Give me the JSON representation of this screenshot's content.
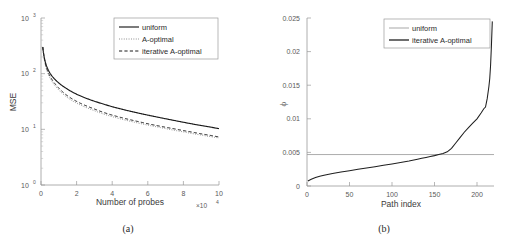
{
  "figure": {
    "background": "#ffffff",
    "panels": [
      "(a)",
      "(b)"
    ]
  },
  "panel_a": {
    "caption": "(a)",
    "xlabel": "Number of probes",
    "ylabel": "MSE",
    "x_multiplier": "×10",
    "x_multiplier_exp": "4",
    "xticks": [
      "0",
      "2",
      "4",
      "6",
      "8",
      "10"
    ],
    "yticks": [
      "10",
      "10",
      "10",
      "10"
    ],
    "ytick_exps": [
      "3",
      "2",
      "1",
      "0"
    ],
    "legend": [
      {
        "label": "uniform",
        "style": "solid",
        "color": "#1a1a1a"
      },
      {
        "label": "A-optimal",
        "style": "dotted",
        "color": "#7d7d7d"
      },
      {
        "label": "iterative A-optimal",
        "style": "dashed",
        "color": "#1a1a1a"
      }
    ]
  },
  "panel_b": {
    "caption": "(b)",
    "xlabel": "Path index",
    "ylabel": "ϕ",
    "xticks": [
      "0",
      "50",
      "100",
      "150",
      "200"
    ],
    "yticks": [
      "0",
      "0.005",
      "0.01",
      "0.015",
      "0.02",
      "0.025"
    ],
    "legend": [
      {
        "label": "uniform",
        "style": "solid",
        "color": "#9d9d9d"
      },
      {
        "label": "iterative A-optimal",
        "style": "solid",
        "color": "#1f1f1f"
      }
    ]
  },
  "chart_data": [
    {
      "type": "line",
      "panel": "(a)",
      "title": "",
      "xlabel": "Number of probes",
      "ylabel": "MSE",
      "xlim": [
        0,
        100000
      ],
      "ylim": [
        1,
        1000
      ],
      "yscale": "log",
      "xscale": "linear",
      "grid": false,
      "legend_position": "top-right",
      "x_tick_values": [
        0,
        20000,
        40000,
        60000,
        80000,
        100000
      ],
      "x_tick_multiplier": 10000,
      "y_tick_values": [
        1,
        10,
        100,
        1000
      ],
      "x": [
        1000,
        2000,
        3000,
        4000,
        6000,
        8000,
        10000,
        14000,
        18000,
        22000,
        26000,
        30000,
        35000,
        40000,
        45000,
        50000,
        55000,
        60000,
        65000,
        70000,
        75000,
        80000,
        85000,
        90000,
        95000,
        100000
      ],
      "series": [
        {
          "name": "uniform",
          "style": "solid",
          "color": "#1a1a1a",
          "values": [
            300,
            185,
            140,
            118,
            92,
            78,
            68,
            55,
            46,
            40,
            35.5,
            32,
            28.5,
            25.5,
            23.2,
            21.2,
            19.5,
            18.0,
            16.7,
            15.5,
            14.4,
            13.4,
            12.5,
            11.7,
            11.0,
            10.3
          ]
        },
        {
          "name": "A-optimal",
          "style": "dotted",
          "color": "#7d7d7d",
          "values": [
            300,
            170,
            122,
            99,
            74,
            60,
            51,
            39,
            32,
            27.5,
            24.2,
            21.6,
            18.9,
            16.9,
            15.3,
            14.0,
            12.9,
            11.9,
            11.1,
            10.3,
            9.6,
            9.0,
            8.4,
            7.9,
            7.4,
            7.0
          ]
        },
        {
          "name": "iterative A-optimal",
          "style": "dashed",
          "color": "#1a1a1a",
          "values": [
            300,
            178,
            130,
            106,
            80,
            65,
            55,
            42,
            34.5,
            29.5,
            26.0,
            23.2,
            20.2,
            18.0,
            16.3,
            14.9,
            13.7,
            12.6,
            11.7,
            10.9,
            10.2,
            9.5,
            8.9,
            8.3,
            7.8,
            7.3
          ]
        }
      ]
    },
    {
      "type": "line",
      "panel": "(b)",
      "title": "",
      "xlabel": "Path index",
      "ylabel": "ϕ",
      "xlim": [
        0,
        220
      ],
      "ylim": [
        0,
        0.025
      ],
      "yscale": "linear",
      "xscale": "linear",
      "grid": false,
      "legend_position": "top-right",
      "x_tick_values": [
        0,
        50,
        100,
        150,
        200
      ],
      "y_tick_values": [
        0,
        0.005,
        0.01,
        0.015,
        0.02,
        0.025
      ],
      "series": [
        {
          "name": "uniform",
          "style": "constant-line",
          "color": "#9d9d9d",
          "constant_value": 0.00468
        },
        {
          "name": "iterative A-optimal",
          "style": "solid",
          "color": "#1f1f1f",
          "x": [
            1,
            5,
            10,
            15,
            20,
            30,
            40,
            50,
            60,
            70,
            80,
            90,
            100,
            110,
            120,
            130,
            135,
            140,
            145,
            150,
            155,
            160,
            165,
            170,
            175,
            180,
            185,
            190,
            195,
            200,
            205,
            208,
            210,
            212,
            214,
            215,
            216,
            217,
            218
          ],
          "values": [
            0.00075,
            0.001,
            0.00125,
            0.00145,
            0.0016,
            0.00185,
            0.00208,
            0.00228,
            0.00248,
            0.00268,
            0.00288,
            0.00308,
            0.00328,
            0.0035,
            0.00372,
            0.00398,
            0.00412,
            0.00425,
            0.00438,
            0.00452,
            0.00468,
            0.00485,
            0.00508,
            0.0056,
            0.0064,
            0.0072,
            0.008,
            0.0087,
            0.00935,
            0.01,
            0.0109,
            0.0115,
            0.01175,
            0.013,
            0.0148,
            0.016,
            0.018,
            0.021,
            0.0245
          ]
        }
      ]
    }
  ]
}
